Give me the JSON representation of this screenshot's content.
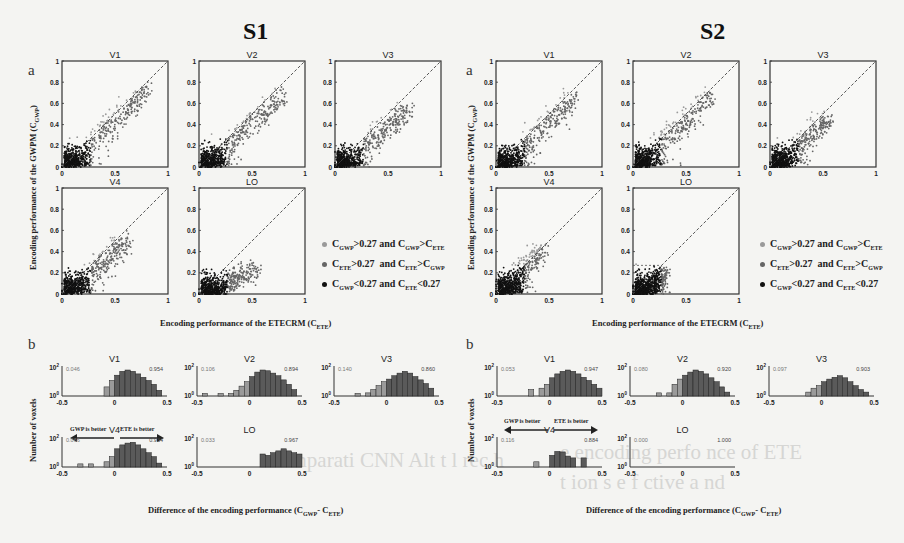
{
  "figure": {
    "left_title": "S1",
    "right_title": "S2",
    "panel_a_letter": "a",
    "panel_b_letter": "b",
    "scatter_ylabel": "Encoding performance of the GWPM (C",
    "scatter_ylabel_sub": "GWP",
    "scatter_xlabel": "Encoding performance of the ETECRM (C",
    "scatter_xlabel_sub": "ETE",
    "hist_ylabel": "Number of voxels",
    "hist_xlabel": "Difference of the encoding performance (C",
    "hist_xlabel_sub1": "GWP",
    "hist_xlabel_sep": "- C",
    "hist_xlabel_sub2": "ETE",
    "arrow_left_label": "GWP is better",
    "arrow_right_label": "ETE is better",
    "legend": [
      {
        "text": "C_GWP>0.27 and C_GWP>C_ETE",
        "color": "#9a9a9a"
      },
      {
        "text": "C_ETE>0.27  and C_ETE>C_GWP",
        "color": "#666666"
      },
      {
        "text": "C_GWP<0.27 and C_ETE<0.27",
        "color": "#111111"
      }
    ],
    "background_ghost_text": [
      "omparati   CNN  Alt   t   l  rec  h",
      "  e  encoding perfo    nce of ETE",
      "  t  ion  s  e  f   ctive  a   nd"
    ]
  },
  "chart_data": [
    {
      "type": "scatter",
      "subject": "S1",
      "title": "S1 panel a: GWPM vs ETECRM encoding performance",
      "xlabel": "Encoding performance of the ETECRM (C_ETE)",
      "ylabel": "Encoding performance of the GWPM (C_GWP)",
      "xlim": [
        0,
        1
      ],
      "ylim": [
        0,
        1
      ],
      "xticks": [
        "0",
        "0.5",
        "1"
      ],
      "yticks": [
        "0",
        "0.2",
        "0.4",
        "0.6",
        "0.8",
        "1"
      ],
      "threshold": 0.27,
      "reference_line": "y = x (dashed)",
      "subplots": [
        {
          "name": "V1",
          "cloud_max_x": 0.8,
          "cloud_max_y": 0.78
        },
        {
          "name": "V2",
          "cloud_max_x": 0.78,
          "cloud_max_y": 0.72
        },
        {
          "name": "V3",
          "cloud_max_x": 0.7,
          "cloud_max_y": 0.6
        },
        {
          "name": "V4",
          "cloud_max_x": 0.62,
          "cloud_max_y": 0.55
        },
        {
          "name": "LO",
          "cloud_max_x": 0.55,
          "cloud_max_y": 0.3
        }
      ]
    },
    {
      "type": "scatter",
      "subject": "S2",
      "title": "S2 panel a: GWPM vs ETECRM encoding performance",
      "xlabel": "Encoding performance of the ETECRM (C_ETE)",
      "ylabel": "Encoding performance of the GWPM (C_GWP)",
      "xlim": [
        0,
        1
      ],
      "ylim": [
        0,
        1
      ],
      "xticks": [
        "0",
        "0.5",
        "1"
      ],
      "yticks": [
        "0",
        "0.2",
        "0.4",
        "0.6",
        "0.8",
        "1"
      ],
      "threshold": 0.27,
      "reference_line": "y = x (dashed)",
      "threshold_box_in_LO": true,
      "subplots": [
        {
          "name": "V1",
          "cloud_max_x": 0.75,
          "cloud_max_y": 0.7
        },
        {
          "name": "V2",
          "cloud_max_x": 0.75,
          "cloud_max_y": 0.72
        },
        {
          "name": "V3",
          "cloud_max_x": 0.55,
          "cloud_max_y": 0.5
        },
        {
          "name": "V4",
          "cloud_max_x": 0.45,
          "cloud_max_y": 0.48
        },
        {
          "name": "LO",
          "cloud_max_x": 0.3,
          "cloud_max_y": 0.25
        }
      ]
    },
    {
      "type": "bar",
      "subject": "S1",
      "title": "S1 panel b: histogram of C_GWP - C_ETE (log scale)",
      "xlabel": "Difference of the encoding performance (C_GWP - C_ETE)",
      "ylabel": "Number of voxels",
      "xlim": [
        -0.5,
        0.5
      ],
      "xticks": [
        "-0.5",
        "0",
        "0.5"
      ],
      "yticks": [
        "10^0",
        "10^2"
      ],
      "subplots": [
        {
          "name": "V1",
          "left_fraction": "0.046",
          "right_fraction": "0.954",
          "bin_start": -0.1,
          "bin_width": 0.05,
          "heights": [
            0.35,
            0.6,
            0.8,
            0.95,
            1.0,
            0.95,
            0.85,
            0.72,
            0.6,
            0.45,
            0.22
          ]
        },
        {
          "name": "V2",
          "left_fraction": "0.106",
          "right_fraction": "0.894",
          "bin_start": -0.45,
          "bin_width": 0.05,
          "heights": [
            0.1,
            0,
            0,
            0.1,
            0,
            0.1,
            0.22,
            0.38,
            0.55,
            0.75,
            0.92,
            1.0,
            0.97,
            0.88,
            0.78,
            0.62,
            0.45,
            0.25
          ]
        },
        {
          "name": "V3",
          "left_fraction": "0.140",
          "right_fraction": "0.860",
          "bin_start": -0.3,
          "bin_width": 0.05,
          "heights": [
            0.1,
            0,
            0.12,
            0.25,
            0.4,
            0.55,
            0.65,
            0.78,
            0.88,
            0.95,
            0.88,
            0.75,
            0.62,
            0.48,
            0.3
          ]
        },
        {
          "name": "V4",
          "left_fraction": "0.066",
          "right_fraction": "0.934",
          "bin_start": -0.35,
          "bin_width": 0.05,
          "heights": [
            0.12,
            0,
            0.12,
            0,
            0,
            0.2,
            0.4,
            0.7,
            0.85,
            0.92,
            0.95,
            0.85,
            0.7,
            0.55,
            0.4,
            0.15
          ]
        },
        {
          "name": "LO",
          "left_fraction": "0.033",
          "right_fraction": "0.967",
          "bin_start": 0.1,
          "bin_width": 0.05,
          "heights": [
            0.5,
            0.45,
            0.55,
            0.62,
            0.7,
            0.62,
            0.55,
            0.5
          ]
        }
      ]
    },
    {
      "type": "bar",
      "subject": "S2",
      "title": "S2 panel b: histogram of C_GWP - C_ETE (log scale)",
      "xlabel": "Difference of the encoding performance (C_GWP - C_ETE)",
      "ylabel": "Number of voxels",
      "xlim": [
        -0.5,
        0.5
      ],
      "xticks": [
        "-0.5",
        "0",
        "0.5"
      ],
      "yticks": [
        "10^0",
        "10^2"
      ],
      "subplots": [
        {
          "name": "V1",
          "left_fraction": "0.053",
          "right_fraction": "0.947",
          "bin_start": -0.2,
          "bin_width": 0.05,
          "heights": [
            0.25,
            0,
            0.3,
            0.45,
            0.7,
            0.85,
            0.95,
            1.0,
            0.95,
            0.85,
            0.72,
            0.6,
            0.45,
            0.3
          ]
        },
        {
          "name": "V2",
          "left_fraction": "0.080",
          "right_fraction": "0.920",
          "bin_start": -0.25,
          "bin_width": 0.05,
          "heights": [
            0.12,
            0,
            0.12,
            0.45,
            0.65,
            0.8,
            0.92,
            1.0,
            0.95,
            0.85,
            0.7,
            0.55,
            0.35,
            0.15
          ]
        },
        {
          "name": "V3",
          "left_fraction": "0.097",
          "right_fraction": "0.903",
          "bin_start": -0.15,
          "bin_width": 0.05,
          "heights": [
            0.15,
            0.3,
            0.4,
            0.55,
            0.65,
            0.72,
            0.78,
            0.7,
            0.55,
            0.4,
            0.25,
            0.15
          ]
        },
        {
          "name": "V4",
          "left_fraction": "0.116",
          "right_fraction": "0.884",
          "bin_start": -0.15,
          "bin_width": 0.05,
          "heights": [
            0.2,
            0,
            0,
            0.45,
            0.6,
            0.58,
            0.42,
            0.35,
            0,
            0.35
          ]
        },
        {
          "name": "LO",
          "left_fraction": "0.000",
          "right_fraction": "1.000",
          "bin_start": 0,
          "bin_width": 0.05,
          "heights": []
        }
      ]
    }
  ]
}
